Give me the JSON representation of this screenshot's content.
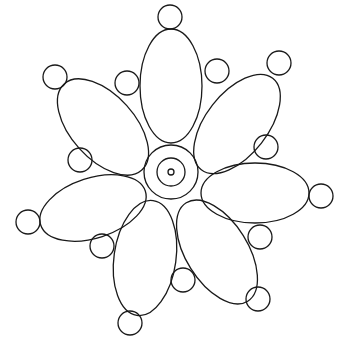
{
  "figure": {
    "type": "flower-line-drawing",
    "stroke": "#1a1a1a",
    "background": "#ffffff",
    "center": {
      "cx": 171,
      "cy": 172,
      "outer_r": 27,
      "inner_r": 14,
      "dot_r": 3
    },
    "petals": [
      {
        "cx": 171,
        "cy": 86,
        "rx": 31,
        "ry": 57,
        "rot": 0
      },
      {
        "cx": 237,
        "cy": 124,
        "rx": 31,
        "ry": 58,
        "rot": 38
      },
      {
        "cx": 255,
        "cy": 193,
        "rx": 54,
        "ry": 30,
        "rot": 0
      },
      {
        "cx": 217,
        "cy": 252,
        "rx": 31,
        "ry": 58,
        "rot": -32
      },
      {
        "cx": 145,
        "cy": 258,
        "rx": 31,
        "ry": 58,
        "rot": 8
      },
      {
        "cx": 93,
        "cy": 208,
        "rx": 55,
        "ry": 30,
        "rot": -18
      },
      {
        "cx": 103,
        "cy": 127,
        "rx": 32,
        "ry": 58,
        "rot": -42
      }
    ],
    "dots": [
      {
        "cx": 170,
        "cy": 17
      },
      {
        "cx": 217,
        "cy": 71
      },
      {
        "cx": 279,
        "cy": 63
      },
      {
        "cx": 266,
        "cy": 147
      },
      {
        "cx": 321,
        "cy": 196
      },
      {
        "cx": 260,
        "cy": 237
      },
      {
        "cx": 258,
        "cy": 299
      },
      {
        "cx": 183,
        "cy": 280
      },
      {
        "cx": 130,
        "cy": 323
      },
      {
        "cx": 102,
        "cy": 246
      },
      {
        "cx": 28,
        "cy": 222
      },
      {
        "cx": 80,
        "cy": 160
      },
      {
        "cx": 55,
        "cy": 77
      },
      {
        "cx": 127,
        "cy": 83
      }
    ],
    "dot_r": 12
  }
}
